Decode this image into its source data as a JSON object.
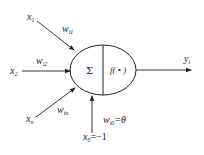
{
  "diagram": {
    "type": "artificial-neuron-model",
    "inputs": [
      {
        "var": "x",
        "sub": "1",
        "weight": "w",
        "weight_sub": "i1"
      },
      {
        "var": "x",
        "sub": "2",
        "weight": "w",
        "weight_sub": "i2"
      },
      {
        "var": "x",
        "sub": "n",
        "weight": "w",
        "weight_sub": "in"
      }
    ],
    "bias": {
      "var": "x",
      "sub": "0",
      "value": "=−1",
      "weight": "w",
      "weight_sub": "i0",
      "weight_value": "=θ"
    },
    "neuron": {
      "sum_symbol": "Σ",
      "activation": "f( • )"
    },
    "output": {
      "var": "y",
      "sub": "i"
    },
    "colors": {
      "stroke": "#222222",
      "background": "#ffffff"
    }
  }
}
